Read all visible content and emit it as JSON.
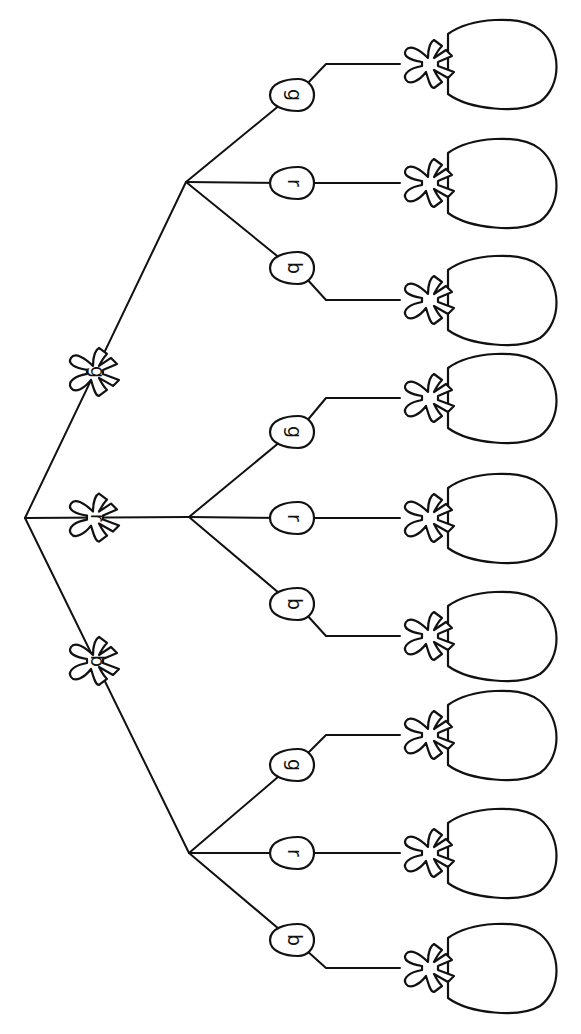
{
  "diagram": {
    "type": "tree",
    "orientation": "rotated-90-clockwise",
    "stroke_color": "#111111",
    "background": "#ffffff",
    "root": {
      "x": 25,
      "y": 518
    },
    "level1": [
      {
        "label": "g",
        "x": 95,
        "y": 340,
        "branch_x": 186,
        "branch_y": 182,
        "children": [
          {
            "label": "g",
            "x": 292,
            "y": 95,
            "leaf_y": 64
          },
          {
            "label": "r",
            "x": 292,
            "y": 183,
            "leaf_y": 183
          },
          {
            "label": "b",
            "x": 292,
            "y": 268,
            "leaf_y": 300
          }
        ]
      },
      {
        "label": "r",
        "x": 95,
        "y": 518,
        "branch_x": 189,
        "branch_y": 517,
        "children": [
          {
            "label": "g",
            "x": 292,
            "y": 432,
            "leaf_y": 398
          },
          {
            "label": "r",
            "x": 292,
            "y": 518,
            "leaf_y": 518
          },
          {
            "label": "b",
            "x": 292,
            "y": 604,
            "leaf_y": 636
          }
        ]
      },
      {
        "label": "b",
        "x": 95,
        "y": 687,
        "branch_x": 189,
        "branch_y": 853,
        "children": [
          {
            "label": "g",
            "x": 292,
            "y": 765,
            "leaf_y": 735
          },
          {
            "label": "r",
            "x": 292,
            "y": 853,
            "leaf_y": 853
          },
          {
            "label": "b",
            "x": 292,
            "y": 940,
            "leaf_y": 968
          }
        ]
      }
    ],
    "leaf_bag_x": 400,
    "leaf_count": 9
  }
}
